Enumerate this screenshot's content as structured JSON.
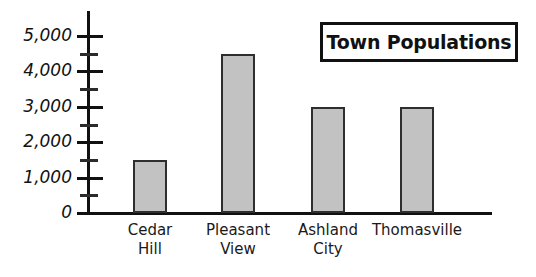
{
  "chart_data": {
    "type": "bar",
    "title": "Town Populations",
    "xlabel": "",
    "ylabel": "",
    "categories": [
      "Cedar Hill",
      "Pleasant View",
      "Ashland City",
      "Thomasville"
    ],
    "values": [
      1500,
      4500,
      3000,
      3000
    ],
    "ylim": [
      0,
      5500
    ],
    "ytick_labels": [
      "0",
      "1,000",
      "2,000",
      "3,000",
      "4,000",
      "5,000"
    ],
    "ytick_values": [
      0,
      1000,
      2000,
      3000,
      4000,
      5000
    ],
    "minor_tick_values": [
      500,
      1500,
      2500,
      3500,
      4500
    ],
    "grid": false,
    "legend": null,
    "bar_color": "#c2c2c2",
    "bar_edge_color": "#2e2e2e",
    "axis_color": "#111111"
  },
  "title_box": {
    "label": "Town Populations"
  },
  "y_axis": {
    "ticks": [
      {
        "label": "5,000",
        "value": 5000
      },
      {
        "label": "4,000",
        "value": 4000
      },
      {
        "label": "3,000",
        "value": 3000
      },
      {
        "label": "2,000",
        "value": 2000
      },
      {
        "label": "1,000",
        "value": 1000
      },
      {
        "label": "0",
        "value": 0
      }
    ]
  },
  "x_axis": {
    "categories": [
      {
        "label": "Cedar\nHill"
      },
      {
        "label": "Pleasant\nView"
      },
      {
        "label": "Ashland\nCity"
      },
      {
        "label": "Thomasville"
      }
    ]
  }
}
